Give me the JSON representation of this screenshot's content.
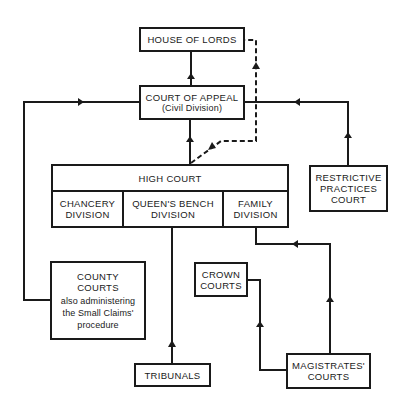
{
  "diagram": {
    "type": "court-hierarchy-flowchart",
    "nodes": {
      "house_of_lords": {
        "label": "HOUSE OF LORDS"
      },
      "court_of_appeal": {
        "label": "COURT OF APPEAL",
        "sublabel": "(Civil Division)"
      },
      "high_court": {
        "label": "HIGH COURT",
        "divisions": [
          {
            "line1": "CHANCERY",
            "line2": "DIVISION"
          },
          {
            "line1": "QUEEN'S BENCH",
            "line2": "DIVISION"
          },
          {
            "line1": "FAMILY",
            "line2": "DIVISION"
          }
        ]
      },
      "restrictive_practices": {
        "line1": "RESTRICTIVE",
        "line2": "PRACTICES",
        "line3": "COURT"
      },
      "county_courts": {
        "line1": "COUNTY",
        "line2": "COURTS",
        "note1": "also administering",
        "note2": "the Small Claims'",
        "note3": "procedure"
      },
      "crown_courts": {
        "line1": "CROWN",
        "line2": "COURTS"
      },
      "tribunals": {
        "label": "TRIBUNALS"
      },
      "magistrates": {
        "line1": "MAGISTRATES'",
        "line2": "COURTS"
      }
    },
    "edges": [
      {
        "from": "court_of_appeal",
        "to": "house_of_lords",
        "style": "solid"
      },
      {
        "from": "high_court",
        "to": "court_of_appeal",
        "style": "solid"
      },
      {
        "from": "high_court",
        "to": "house_of_lords",
        "style": "dashed"
      },
      {
        "from": "county_courts",
        "to": "court_of_appeal",
        "style": "solid"
      },
      {
        "from": "restrictive_practices",
        "to": "court_of_appeal",
        "style": "solid"
      },
      {
        "from": "tribunals",
        "to": "high_court.queens_bench",
        "style": "solid"
      },
      {
        "from": "magistrates",
        "to": "high_court.family",
        "style": "solid"
      },
      {
        "from": "magistrates",
        "to": "crown_courts",
        "style": "solid"
      }
    ],
    "colors": {
      "line": "#1a1a1a",
      "background": "#ffffff"
    }
  }
}
